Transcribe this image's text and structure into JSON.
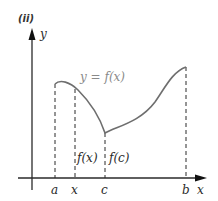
{
  "panel_label": "(ii)",
  "axes": {
    "y_label": "y",
    "x_label": "x",
    "color": "#2a2a2a"
  },
  "curve": {
    "label": "y = f(x)",
    "color": "#6e6e6e",
    "label_color": "#8a8a8a"
  },
  "ticks": {
    "a": "a",
    "x": "x",
    "c": "c",
    "b": "b"
  },
  "segment_labels": {
    "fx": "f(x)",
    "fc": "f(c)"
  }
}
